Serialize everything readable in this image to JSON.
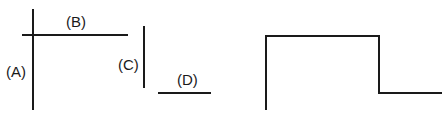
{
  "diagram": {
    "stroke_color": "#1a1a1a",
    "labels": {
      "a": "(A)",
      "b": "(B)",
      "c": "(C)",
      "d": "(D)"
    },
    "segments": [
      {
        "id": "A",
        "orientation": "vertical"
      },
      {
        "id": "B",
        "orientation": "horizontal"
      },
      {
        "id": "C",
        "orientation": "vertical"
      },
      {
        "id": "D",
        "orientation": "horizontal"
      }
    ],
    "step_shape": {
      "description": "rectangular pulse step outline"
    }
  }
}
